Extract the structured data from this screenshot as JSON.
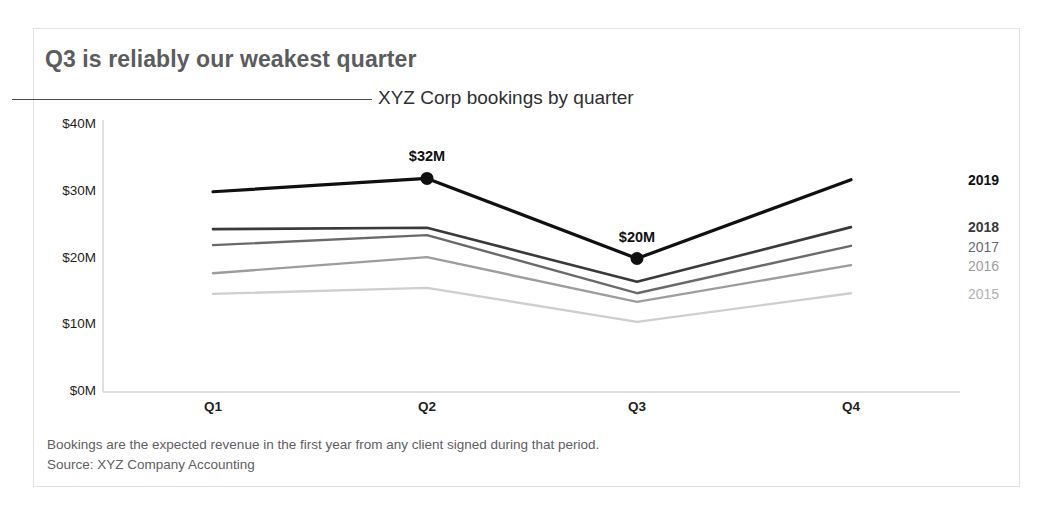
{
  "title": "Q3 is reliably our weakest quarter",
  "subtitle": "XYZ Corp bookings by quarter",
  "footnote": {
    "line1": "Bookings are the expected revenue in the first year from any client signed during that period.",
    "line2": "Source: XYZ Company Accounting"
  },
  "colors": {
    "title": "#5b5c5e",
    "subtitle": "#2f2f31",
    "rule": "#4b4b4d",
    "frame": "#e2e2e2",
    "axis": "#d4d4d4",
    "footnote": "#5f6063",
    "series_2019": "#101012",
    "series_2018": "#3a3a3c",
    "series_2017": "#6a6a6c",
    "series_2016": "#9d9d9f",
    "series_2015": "#cfcfd1"
  },
  "chart_data": {
    "type": "line",
    "title": "Q3 is reliably our weakest quarter",
    "subtitle": "XYZ Corp bookings by quarter",
    "xlabel": "",
    "ylabel": "",
    "categories": [
      "Q1",
      "Q2",
      "Q3",
      "Q4"
    ],
    "x_tick_labels": [
      "Q1",
      "Q2",
      "Q3",
      "Q4"
    ],
    "y_tick_labels": [
      "$0M",
      "$10M",
      "$20M",
      "$30M",
      "$40M"
    ],
    "y_tick_values": [
      0,
      10,
      20,
      30,
      40
    ],
    "ylim": [
      0,
      40
    ],
    "y_unit": "$M",
    "grid": false,
    "legend": "right-of-line-ends",
    "series": [
      {
        "name": "2019",
        "values": [
          30.0,
          32.0,
          20.0,
          31.8
        ],
        "color": "#101012",
        "width": 3.2,
        "label_bold": true
      },
      {
        "name": "2018",
        "values": [
          24.4,
          24.6,
          16.5,
          24.7
        ],
        "color": "#3a3a3c",
        "width": 2.6,
        "label_bold": true
      },
      {
        "name": "2017",
        "values": [
          22.0,
          23.5,
          14.8,
          21.9
        ],
        "color": "#6a6a6c",
        "width": 2.4,
        "label_bold": false
      },
      {
        "name": "2016",
        "values": [
          17.8,
          20.2,
          13.5,
          19.0
        ],
        "color": "#9d9d9f",
        "width": 2.4,
        "label_bold": false
      },
      {
        "name": "2015",
        "values": [
          14.7,
          15.6,
          10.5,
          14.8
        ],
        "color": "#cfcfd1",
        "width": 2.4,
        "label_bold": false
      }
    ],
    "annotations": [
      {
        "text": "$32M",
        "series": "2019",
        "category": "Q2",
        "value": 32
      },
      {
        "text": "$20M",
        "series": "2019",
        "category": "Q3",
        "value": 20
      }
    ],
    "markers": [
      {
        "series": "2019",
        "category": "Q2",
        "value": 32
      },
      {
        "series": "2019",
        "category": "Q3",
        "value": 20
      }
    ],
    "notes": [
      "Bookings are the expected revenue in the first year from any client signed during that period.",
      "Source: XYZ Company Accounting"
    ]
  }
}
